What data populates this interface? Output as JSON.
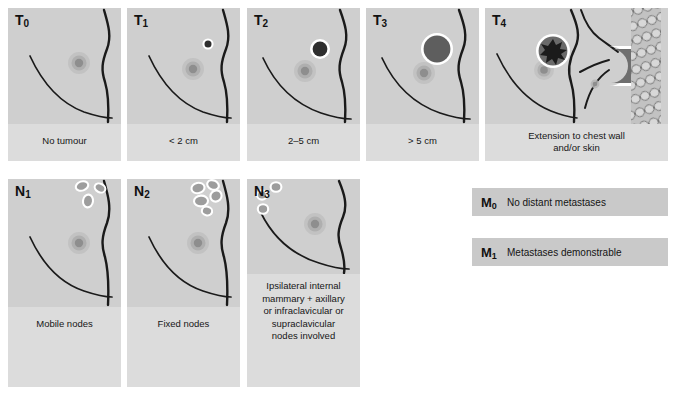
{
  "figure": {
    "background_color": "#ffffff",
    "panel_color": "#cfcfcf",
    "caption_band_color": "#dcdcdc",
    "outline_color": "#1a1a1a",
    "tumour_dark_color": "#3a3a3a",
    "node_color": "#9a9a9a",
    "node_outline_color": "#ffffff"
  },
  "t_stages": [
    {
      "code": "T",
      "subscript": "0",
      "caption": "No tumour",
      "tumour": "none"
    },
    {
      "code": "T",
      "subscript": "1",
      "caption": "< 2 cm",
      "tumour": "small-dark-nodule"
    },
    {
      "code": "T",
      "subscript": "2",
      "caption": "2–5 cm",
      "tumour": "medium-dark-nodule"
    },
    {
      "code": "T",
      "subscript": "3",
      "caption": "> 5 cm",
      "tumour": "large-grey-nodule"
    },
    {
      "code": "T",
      "subscript": "4",
      "caption": "Extension to chest wall and/or skin",
      "caption_line1": "Extension to chest wall",
      "caption_line2": "and/or skin",
      "tumour": "star-shaped-tumour-with-chest-wall-invasion"
    }
  ],
  "n_stages": [
    {
      "code": "N",
      "subscript": "1",
      "caption": "Mobile nodes",
      "nodes": "three-separate-axillary-nodes"
    },
    {
      "code": "N",
      "subscript": "2",
      "caption": "Fixed nodes",
      "nodes": "matted-fixed-axillary-nodes"
    },
    {
      "code": "N",
      "subscript": "3",
      "caption": "Ipsilateral internal mammary + axillary or infraclavicular or supraclavicular nodes involved",
      "caption_lines": [
        "Ipsilateral internal",
        "mammary + axillary",
        "or infraclavicular or",
        "supraclavicular",
        "nodes involved"
      ],
      "nodes": "internal-mammary-nodes"
    }
  ],
  "m_stages": [
    {
      "code": "M",
      "subscript": "0",
      "text": "No distant metastases"
    },
    {
      "code": "M",
      "subscript": "1",
      "text": "Metastases demonstrable"
    }
  ]
}
